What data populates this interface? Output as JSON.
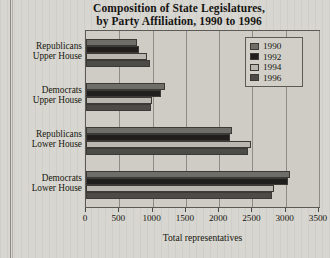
{
  "chart_data": {
    "type": "bar",
    "orientation": "horizontal",
    "title": "Composition of State Legislatures, by Party Affiliation, 1990 to 1996",
    "title_line1": "Composition of State Legislatures,",
    "title_line2": "by Party Affiliation, 1990 to 1996",
    "xlabel": "Total representatives",
    "ylabel": "",
    "xlim": [
      0,
      3500
    ],
    "xticks": [
      0,
      500,
      1000,
      1500,
      2000,
      2500,
      3000,
      3500
    ],
    "xtick_labels": [
      "0",
      "500",
      "1000",
      "1500",
      "2000",
      "2500",
      "3000",
      "3500"
    ],
    "grid": true,
    "legend_position": "top-right",
    "categories": [
      "Republicans Upper House",
      "Democrats Upper House",
      "Republicans Lower House",
      "Democrats Lower House"
    ],
    "category_lines": [
      [
        "Republicans",
        "Upper House"
      ],
      [
        "Democrats",
        "Upper House"
      ],
      [
        "Republicans",
        "Lower House"
      ],
      [
        "Democrats",
        "Lower House"
      ]
    ],
    "series": [
      {
        "name": "1990",
        "color": "#6f6d68",
        "values": [
          770,
          1180,
          2190,
          3060
        ]
      },
      {
        "name": "1992",
        "color": "#211f1d",
        "values": [
          800,
          1130,
          2170,
          3030
        ]
      },
      {
        "name": "1994",
        "color": "#bab7b1",
        "values": [
          920,
          990,
          2480,
          2830
        ]
      },
      {
        "name": "1996",
        "color": "#4d4b47",
        "values": [
          960,
          980,
          2430,
          2800
        ]
      }
    ]
  },
  "legend": {
    "items": [
      {
        "label": "1990"
      },
      {
        "label": "1992"
      },
      {
        "label": "1994"
      },
      {
        "label": "1996"
      }
    ]
  }
}
